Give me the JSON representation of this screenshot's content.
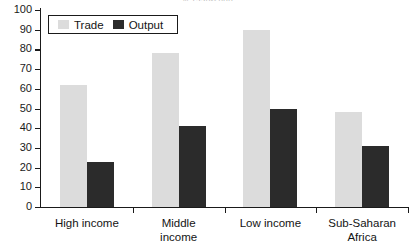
{
  "chart_data": {
    "type": "bar",
    "title": "% 1990-2000",
    "xlabel": "",
    "ylabel": "",
    "ylim": [
      0,
      100
    ],
    "ytick_step": 10,
    "yticks": [
      100,
      90,
      80,
      70,
      60,
      50,
      40,
      30,
      20,
      10,
      0
    ],
    "grid": false,
    "legend_position": "top-left-inside",
    "categories": [
      "High income",
      "Middle income",
      "Low income",
      "Sub-Saharan Africa"
    ],
    "series": [
      {
        "name": "Trade",
        "color": "#dcdcdc",
        "values": [
          62,
          78,
          90,
          48
        ]
      },
      {
        "name": "Output",
        "color": "#2b2b2b",
        "values": [
          23,
          41,
          50,
          31
        ]
      }
    ]
  },
  "legend": {
    "items": [
      {
        "label": "Trade",
        "swatch": "trade"
      },
      {
        "label": "Output",
        "swatch": "output"
      }
    ]
  },
  "axis": {
    "y_labels": [
      "100",
      "90",
      "80",
      "70",
      "60",
      "50",
      "40",
      "30",
      "20",
      "10",
      "0"
    ],
    "x_labels": [
      "High income",
      "Middle\nincome",
      "Low income",
      "Sub-Saharan\nAfrica"
    ]
  },
  "colors": {
    "trade": "#dcdcdc",
    "output": "#2b2b2b",
    "axis": "#1a1a1a",
    "background": "#ffffff",
    "title": "#b9b9b9"
  }
}
